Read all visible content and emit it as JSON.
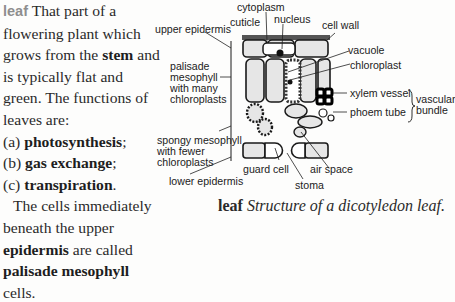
{
  "entry": {
    "headword": "leaf",
    "line1": "That part of a flowering plant which grows from the",
    "stem": "stem",
    "line2": "and is typically flat and green. The functions of leaves are:",
    "functions": [
      {
        "marker": "(a)",
        "term": "photosynthesis",
        "punct": ";"
      },
      {
        "marker": "(b)",
        "term": "gas exchange",
        "punct": ";"
      },
      {
        "marker": "(c)",
        "term": "transpiration",
        "punct": "."
      }
    ],
    "para2_start": "The cells immediately beneath the upper",
    "epidermis": "epidermis",
    "para2_mid": "are called",
    "palisade": "palisade mesophyll",
    "para2_end": "cells."
  },
  "diagram": {
    "labels": {
      "cytoplasm": "cytoplasm",
      "cuticle": "cuticle",
      "nucleus": "nucleus",
      "cell_wall": "cell wall",
      "upper_epidermis": "upper epidermis",
      "vacuole": "vacuole",
      "palisade_1": "palisade",
      "palisade_2": "mesophyll",
      "palisade_3": "with many",
      "palisade_4": "chloroplasts",
      "chloroplast": "chloroplast",
      "xylem": "xylem vessel",
      "phloem": "phoem tube",
      "vascular_1": "vascular",
      "vascular_2": "bundle",
      "spongy_1": "spongy mesophyll",
      "spongy_2": "with fewer",
      "spongy_3": "chloroplasts",
      "guard_cell": "guard cell",
      "air_space": "air space",
      "lower_epidermis": "lower epidermis",
      "stoma": "stoma"
    }
  },
  "caption": {
    "headword": "leaf",
    "text": "Structure of a dicotyledon leaf."
  }
}
